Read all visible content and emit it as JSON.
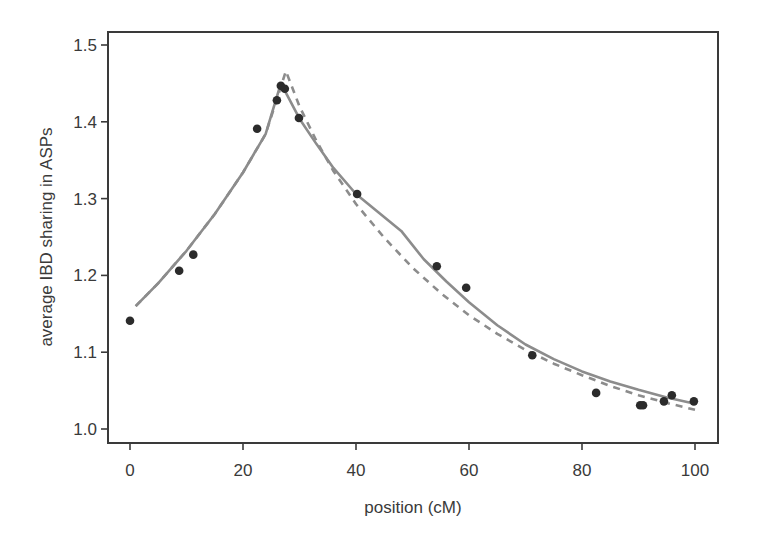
{
  "chart_data": {
    "type": "scatter",
    "title": "",
    "xlabel": "position (cM)",
    "ylabel": "average IBD sharing in ASPs",
    "xlim": [
      -4,
      104
    ],
    "ylim": [
      0.982,
      1.519
    ],
    "xticks": [
      0,
      20,
      40,
      60,
      80,
      100
    ],
    "xtick_labels": [
      "0",
      "20",
      "40",
      "60",
      "80",
      "100"
    ],
    "yticks": [
      1.0,
      1.1,
      1.2,
      1.3,
      1.4,
      1.5
    ],
    "ytick_labels": [
      "1.0",
      "1.1",
      "1.2",
      "1.3",
      "1.4",
      "1.5"
    ],
    "grid": false,
    "legend": null,
    "series": [
      {
        "name": "observed",
        "kind": "points",
        "color": "#2b2b2b",
        "x": [
          0,
          8.7,
          11.2,
          22.5,
          26.0,
          26.7,
          27.4,
          29.9,
          40.2,
          54.3,
          59.5,
          71.2,
          82.5,
          90.3,
          90.8,
          94.5,
          95.9,
          99.8
        ],
        "y": [
          1.141,
          1.206,
          1.227,
          1.391,
          1.428,
          1.447,
          1.443,
          1.405,
          1.306,
          1.212,
          1.184,
          1.096,
          1.047,
          1.031,
          1.031,
          1.036,
          1.044,
          1.036
        ]
      },
      {
        "name": "fitted (solid)",
        "kind": "line",
        "style": "solid",
        "color": "#8c8c8c",
        "x": [
          1,
          5,
          10,
          15,
          20,
          24,
          26.7,
          28,
          30,
          33,
          36,
          40,
          44,
          48,
          52,
          56,
          60,
          65,
          70,
          75,
          80,
          85,
          90,
          95,
          100
        ],
        "y": [
          1.16,
          1.19,
          1.232,
          1.28,
          1.334,
          1.384,
          1.45,
          1.432,
          1.404,
          1.371,
          1.34,
          1.306,
          1.282,
          1.258,
          1.221,
          1.192,
          1.165,
          1.135,
          1.11,
          1.091,
          1.075,
          1.062,
          1.051,
          1.041,
          1.033
        ]
      },
      {
        "name": "fitted (dashed)",
        "kind": "line",
        "style": "dashed",
        "color": "#8c8c8c",
        "x": [
          1,
          5,
          10,
          15,
          20,
          24,
          27.6,
          30,
          33,
          36,
          40,
          45,
          50,
          55,
          60,
          65,
          70,
          75,
          80,
          85,
          90,
          95,
          100
        ],
        "y": [
          1.16,
          1.19,
          1.232,
          1.28,
          1.334,
          1.384,
          1.466,
          1.42,
          1.375,
          1.336,
          1.293,
          1.249,
          1.21,
          1.177,
          1.148,
          1.124,
          1.103,
          1.085,
          1.07,
          1.056,
          1.044,
          1.034,
          1.025
        ]
      }
    ]
  },
  "plot_area": {
    "left": 108,
    "top": 32,
    "right": 718,
    "bottom": 443
  },
  "axis_mapping": {
    "x0_px": 130,
    "x100_px": 695,
    "y1_0_px": 429,
    "y1_5_px": 45
  }
}
